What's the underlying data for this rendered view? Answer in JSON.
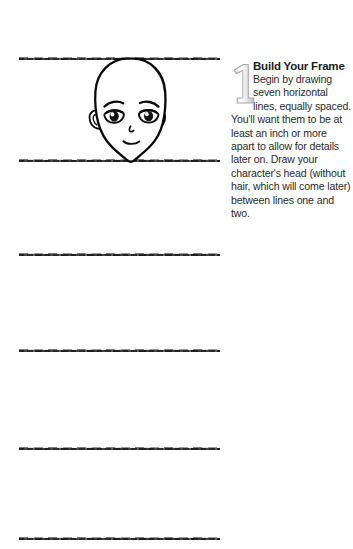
{
  "page": {
    "background_color": "#ffffff",
    "ink_color": "#111111"
  },
  "sketch": {
    "name": "frame-guide-lines-with-head",
    "line_count_visible": 6,
    "line_label": "horizontal guide line",
    "head_label": "manga character head without hair",
    "lines": [
      {
        "id": "line-1",
        "y": 58
      },
      {
        "id": "line-2",
        "y": 160
      },
      {
        "id": "line-3",
        "y": 254
      },
      {
        "id": "line-4",
        "y": 350
      },
      {
        "id": "line-5",
        "y": 448
      },
      {
        "id": "line-6",
        "y": 538
      }
    ]
  },
  "step": {
    "number": "1",
    "heading": "Build Your Frame",
    "body": "Begin by drawing seven horizontal lines, equally spaced. You'll want them to be at least an inch or more apart to allow for details later on. Draw your character's head (without hair, which will come later) between lines one and two.",
    "number_color": "#c9c9c9"
  }
}
